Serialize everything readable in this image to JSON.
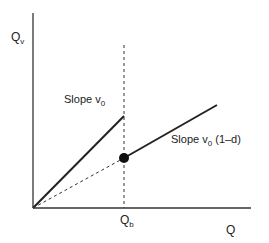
{
  "diagram": {
    "y_axis_label": "Q",
    "y_axis_label_sub": "v",
    "x_axis_label": "Q",
    "threshold_label": "Q",
    "threshold_label_sub": "b",
    "slope1_label": "Slope v",
    "slope1_sub": "0",
    "slope2_label": "Slope v",
    "slope2_sub": "0",
    "slope2_suffix": " (1–d)"
  },
  "colors": {
    "line": "#222222",
    "background": "#ffffff"
  }
}
